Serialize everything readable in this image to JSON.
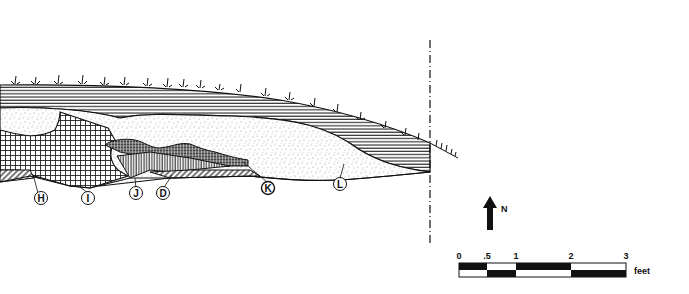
{
  "figure": {
    "type": "stratigraphic-profile",
    "layers": [
      {
        "id": "sod",
        "pattern": "horizontal-lines"
      },
      {
        "id": "sand",
        "pattern": "stipple"
      },
      {
        "id": "grid-fill",
        "pattern": "crosshatch"
      },
      {
        "id": "fine-grid",
        "pattern": "dense-crosshatch"
      },
      {
        "id": "vertical-band",
        "pattern": "vertical-lines"
      },
      {
        "id": "base",
        "pattern": "diagonal-lines"
      }
    ],
    "labels": [
      {
        "text": "H",
        "x": 38,
        "y": 198
      },
      {
        "text": "I",
        "x": 88,
        "y": 198
      },
      {
        "text": "J",
        "x": 136,
        "y": 194
      },
      {
        "text": "D",
        "x": 163,
        "y": 194
      },
      {
        "text": "K",
        "x": 267,
        "y": 188
      },
      {
        "text": "L",
        "x": 340,
        "y": 184
      }
    ],
    "section_line": {
      "x": 430,
      "style": "dash-dot"
    }
  },
  "north_arrow": {
    "label": "N"
  },
  "scale_bar": {
    "ticks": [
      "0",
      ".5",
      "1",
      "2",
      "3"
    ],
    "unit": "feet"
  },
  "colors": {
    "ink": "#111111",
    "paper": "#ffffff",
    "shade": "#9a9a9a"
  }
}
